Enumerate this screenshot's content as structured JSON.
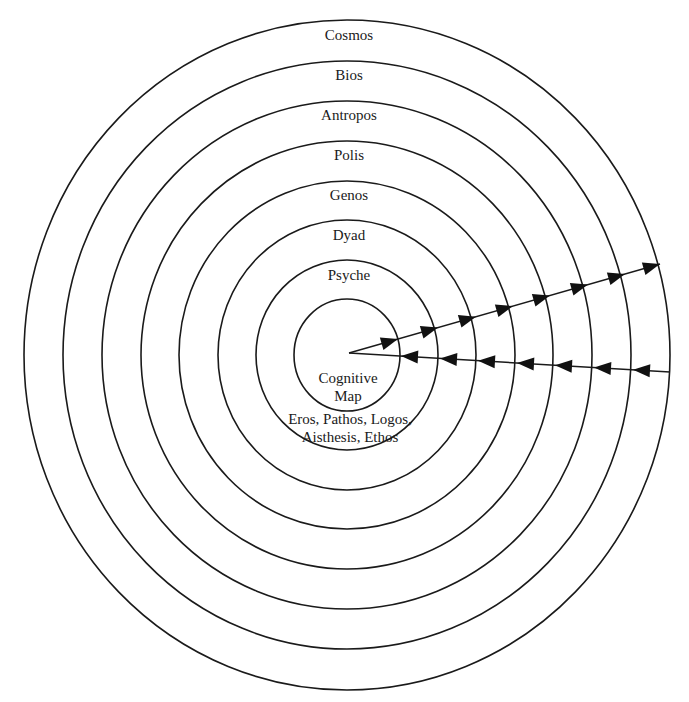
{
  "diagram": {
    "center": {
      "x": 347,
      "y": 355
    },
    "rings": [
      {
        "name": "cognitive-map",
        "rx": 53,
        "ry": 56
      },
      {
        "name": "inner-faculties",
        "rx": 91,
        "ry": 95
      },
      {
        "name": "psyche",
        "rx": 129,
        "ry": 135
      },
      {
        "name": "dyad",
        "rx": 168,
        "ry": 174
      },
      {
        "name": "genos",
        "rx": 206,
        "ry": 214
      },
      {
        "name": "polis",
        "rx": 245,
        "ry": 254
      },
      {
        "name": "antropos",
        "rx": 284,
        "ry": 294
      },
      {
        "name": "bios",
        "rx": 323,
        "ry": 335
      }
    ],
    "labels": [
      {
        "id": "cosmos",
        "text": "Cosmos",
        "x": 349,
        "y": 26
      },
      {
        "id": "bios",
        "text": "Bios",
        "x": 349,
        "y": 66
      },
      {
        "id": "antropos",
        "text": "Antropos",
        "x": 349,
        "y": 106
      },
      {
        "id": "polis",
        "text": "Polis",
        "x": 349,
        "y": 146
      },
      {
        "id": "genos",
        "text": "Genos",
        "x": 349,
        "y": 186
      },
      {
        "id": "dyad",
        "text": "Dyad",
        "x": 349,
        "y": 226
      },
      {
        "id": "psyche",
        "text": "Psyche",
        "x": 349,
        "y": 266
      },
      {
        "id": "cognitive",
        "text": "Cognitive",
        "x": 348,
        "y": 369
      },
      {
        "id": "map",
        "text": "Map",
        "x": 348,
        "y": 387
      },
      {
        "id": "faculties-1",
        "text": "Eros, Pathos, Logos,",
        "x": 350,
        "y": 410
      },
      {
        "id": "faculties-2",
        "text": "Aisthesis, Ethos",
        "x": 350,
        "y": 428
      }
    ],
    "outgoing_line": {
      "x1": 349,
      "y1": 353,
      "x2": 660,
      "y2": 264
    },
    "outgoing_arrow_tips_x": [
      398,
      438,
      476,
      513,
      550,
      588,
      625,
      660
    ],
    "incoming_line": {
      "x1": 670,
      "y1": 372,
      "x2": 349,
      "y2": 353
    },
    "incoming_arrow_tips_x": [
      401,
      440,
      478,
      517,
      555,
      594,
      633
    ],
    "colors": {
      "stroke": "#1a1a1a",
      "background": "#ffffff"
    }
  }
}
